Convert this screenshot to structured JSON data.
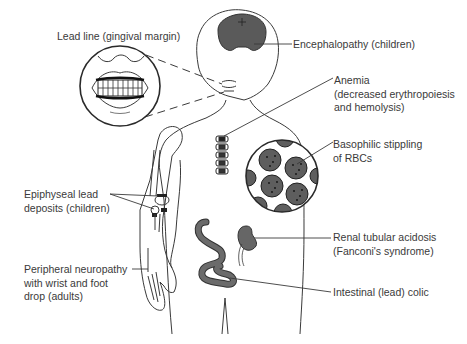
{
  "figure": {
    "colors": {
      "background": "#ffffff",
      "line": "#3a3a3a",
      "organ_fill": "#6b6b6b",
      "text": "#3a3a3a"
    }
  },
  "labels": {
    "lead_line": {
      "lines": [
        "Lead line (gingival margin)"
      ]
    },
    "encephalopathy": {
      "lines": [
        "Encephalopathy (children)"
      ]
    },
    "anemia": {
      "lines": [
        "Anemia",
        "(decreased erythropoiesis",
        "and hemolysis)"
      ]
    },
    "basophilic": {
      "lines": [
        "Basophilic stippling",
        "of RBCs"
      ]
    },
    "epiphyseal": {
      "lines": [
        "Epiphyseal lead",
        "deposits (children)"
      ]
    },
    "renal": {
      "lines": [
        "Renal tubular acidosis",
        "(Fanconi's syndrome)"
      ]
    },
    "neuropathy": {
      "lines": [
        "Peripheral neuropathy",
        "with wrist and foot",
        "drop (adults)"
      ]
    },
    "colic": {
      "lines": [
        "Intestinal (lead) colic"
      ]
    }
  }
}
